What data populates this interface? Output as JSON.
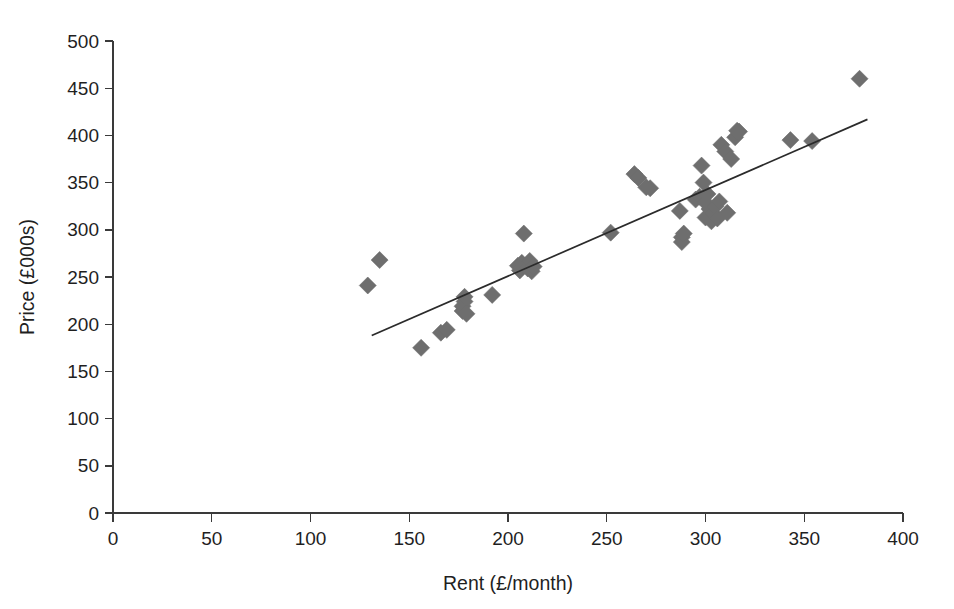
{
  "chart_data": {
    "type": "scatter",
    "title": "",
    "xlabel": "Rent (£/month)",
    "ylabel": "Price (£000s)",
    "xlim": [
      0,
      400
    ],
    "ylim": [
      0,
      500
    ],
    "xticks": [
      0,
      50,
      100,
      150,
      200,
      250,
      300,
      350,
      400
    ],
    "yticks": [
      0,
      50,
      100,
      150,
      200,
      250,
      300,
      350,
      400,
      450,
      500
    ],
    "xtick_labels": [
      "0",
      "50",
      "100",
      "150",
      "200",
      "250",
      "300",
      "350",
      "400"
    ],
    "ytick_labels": [
      "0",
      "50",
      "100",
      "150",
      "200",
      "250",
      "300",
      "350",
      "400",
      "450",
      "500"
    ],
    "grid": false,
    "legend": false,
    "legend_position": "none",
    "marker": "diamond",
    "marker_color": "#6e6e6e",
    "line_color": "#2b2b2b",
    "series": [
      {
        "name": "Properties",
        "points": [
          [
            129,
            241
          ],
          [
            135,
            268
          ],
          [
            156,
            175
          ],
          [
            166,
            191
          ],
          [
            169,
            194
          ],
          [
            177,
            214
          ],
          [
            177,
            219
          ],
          [
            178,
            224
          ],
          [
            178,
            229
          ],
          [
            179,
            211
          ],
          [
            192,
            231
          ],
          [
            205,
            262
          ],
          [
            206,
            257
          ],
          [
            207,
            265
          ],
          [
            208,
            296
          ],
          [
            210,
            259
          ],
          [
            211,
            267
          ],
          [
            212,
            256
          ],
          [
            213,
            261
          ],
          [
            252,
            297
          ],
          [
            264,
            359
          ],
          [
            266,
            355
          ],
          [
            270,
            345
          ],
          [
            272,
            344
          ],
          [
            287,
            320
          ],
          [
            288,
            292
          ],
          [
            288,
            287
          ],
          [
            289,
            296
          ],
          [
            295,
            332
          ],
          [
            297,
            335
          ],
          [
            298,
            368
          ],
          [
            299,
            350
          ],
          [
            300,
            329
          ],
          [
            300,
            313
          ],
          [
            301,
            338
          ],
          [
            302,
            322
          ],
          [
            303,
            309
          ],
          [
            304,
            317
          ],
          [
            305,
            325
          ],
          [
            306,
            312
          ],
          [
            307,
            330
          ],
          [
            308,
            390
          ],
          [
            310,
            383
          ],
          [
            311,
            318
          ],
          [
            313,
            375
          ],
          [
            315,
            398
          ],
          [
            316,
            405
          ],
          [
            317,
            404
          ],
          [
            343,
            395
          ],
          [
            354,
            394
          ],
          [
            378,
            460
          ]
        ]
      }
    ],
    "trendline": {
      "name": "Linear fit",
      "x_start": 131,
      "y_start": 188,
      "x_end": 382,
      "y_end": 417
    }
  },
  "axes": {
    "x_title": "Rent (£/month)",
    "y_title": "Price (£000s)"
  }
}
